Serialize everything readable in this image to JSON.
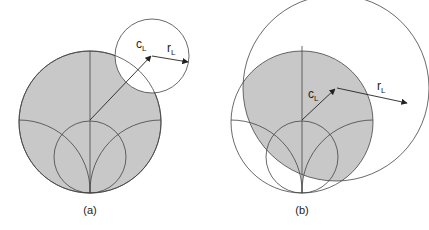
{
  "figure": {
    "panels": [
      {
        "id": "a",
        "caption": "(a)",
        "center_label": "c",
        "center_label_sub": "L",
        "radius_label": "r",
        "radius_label_sub": "L",
        "description": "Load stability circle outside the Smith chart; stable region is the chart area outside the circle"
      },
      {
        "id": "b",
        "caption": "(b)",
        "center_label": "c",
        "center_label_sub": "L",
        "radius_label": "r",
        "radius_label_sub": "L",
        "description": "Load stability circle overlapping the Smith chart; stable region is the intersection"
      }
    ],
    "colors": {
      "shade": "#c8c8c8",
      "line": "#444444",
      "background": "#ffffff"
    }
  }
}
